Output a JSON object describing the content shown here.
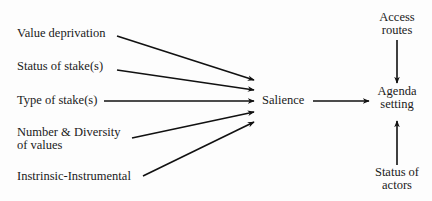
{
  "diagram": {
    "type": "flow",
    "inputs": [
      {
        "label": "Value deprivation"
      },
      {
        "label": "Status of stake(s)"
      },
      {
        "label": "Type of stake(s)"
      },
      {
        "label_line1": "Number & Diversity",
        "label_line2": "of values"
      },
      {
        "label": "Instrinsic-Instrumental"
      }
    ],
    "center_node": {
      "label": "Salience"
    },
    "target_node": {
      "label_line1": "Agenda",
      "label_line2": "setting"
    },
    "top_node": {
      "label_line1": "Access",
      "label_line2": "routes"
    },
    "bottom_node": {
      "label_line1": "Status of",
      "label_line2": "actors"
    },
    "edges": [
      {
        "from": "Value deprivation",
        "to": "Salience"
      },
      {
        "from": "Status of stake(s)",
        "to": "Salience"
      },
      {
        "from": "Type of stake(s)",
        "to": "Salience"
      },
      {
        "from": "Number & Diversity of values",
        "to": "Salience"
      },
      {
        "from": "Instrinsic-Instrumental",
        "to": "Salience"
      },
      {
        "from": "Salience",
        "to": "Agenda setting"
      },
      {
        "from": "Access routes",
        "to": "Agenda setting"
      },
      {
        "from": "Status of actors",
        "to": "Agenda setting"
      }
    ],
    "line_color": "#111111"
  }
}
